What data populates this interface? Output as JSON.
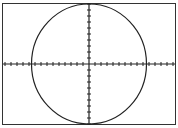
{
  "chart_data": {
    "type": "line",
    "title": "",
    "xlabel": "",
    "ylabel": "",
    "x_ticks_each_side": 14,
    "y_ticks_each_side": 10,
    "circle": {
      "center": [
        0,
        0
      ],
      "radius_ticks": 10
    },
    "grid": false,
    "colors": {
      "stroke": "#222222",
      "background": "#ffffff"
    }
  }
}
